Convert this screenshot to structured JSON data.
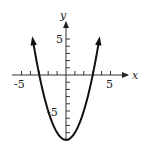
{
  "chart_data": {
    "type": "line",
    "title": "",
    "xlabel": "x",
    "ylabel": "y",
    "function": "y = x^2 - 9",
    "xlim": [
      -6,
      7
    ],
    "ylim": [
      -9.5,
      7
    ],
    "x_ticks": [
      -5,
      -4,
      -3,
      -2,
      -1,
      1,
      2,
      3,
      4,
      5
    ],
    "y_ticks": [
      -9,
      -8,
      -7,
      -6,
      -5,
      -4,
      -3,
      -2,
      -1,
      1,
      2,
      3,
      4,
      5
    ],
    "x_tick_labels": [
      "-5",
      "5"
    ],
    "y_tick_labels": [
      "5",
      "-5"
    ],
    "grid": false,
    "series": [
      {
        "name": "parabola",
        "x": [
          -3.7,
          -3,
          -2,
          -1,
          0,
          1,
          2,
          3,
          3.7
        ],
        "y": [
          4.7,
          0,
          -5,
          -8,
          -9,
          -8,
          -5,
          0,
          4.7
        ],
        "arrows_at_ends": true
      }
    ],
    "key_points": {
      "vertex": [
        0,
        -9
      ],
      "x_intercepts": [
        -3,
        3
      ],
      "y_intercept": -9
    }
  },
  "labels": {
    "x_axis": "x",
    "y_axis": "y",
    "x_neg5": "-5",
    "x_pos5": "5",
    "y_pos5": "5",
    "y_neg5": "-5"
  },
  "colors": {
    "curve": "#111111",
    "axes": "#333333"
  }
}
